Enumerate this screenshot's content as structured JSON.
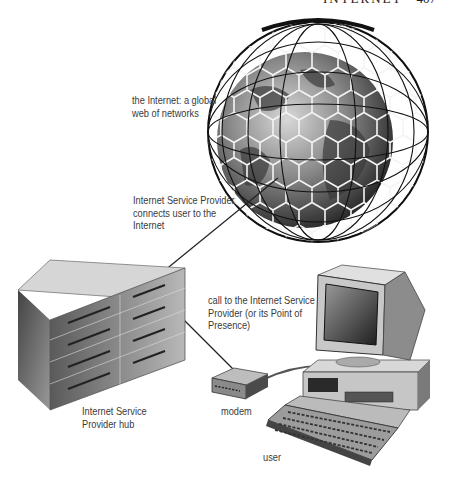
{
  "header": {
    "running_title": "INTERNET",
    "page_number": "407"
  },
  "labels": {
    "internet": [
      "the Internet: a global",
      "web of networks"
    ],
    "isp_role": [
      "Internet Service Provider",
      "connects user to the",
      "Internet"
    ],
    "call": [
      "call to the Internet Service",
      "Provider (or its Point of",
      "Presence)"
    ],
    "hub": [
      "Internet Service",
      "Provider hub"
    ],
    "modem": "modem",
    "user": "user"
  },
  "components": {
    "globe": "internet-globe-hex-mesh",
    "hub": "isp-hub-server-rack",
    "modem": "modem-device",
    "computer": "desktop-computer-with-keyboard"
  },
  "colors": {
    "ink": "#222222",
    "label": "#3a3a3a",
    "background": "#ffffff"
  }
}
